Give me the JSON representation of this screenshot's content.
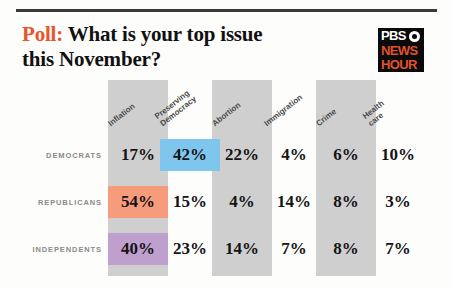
{
  "header": {
    "poll_label": "Poll:",
    "title_line1": "What is your top issue",
    "title_line2": "this November?"
  },
  "logo": {
    "pbs": "PBS",
    "news": "NEWS",
    "hour": "HOUR"
  },
  "colors": {
    "accent_orange": "#e8552a",
    "band_gray": "#cfcfcf",
    "highlight_blue": "#7fc6ee",
    "highlight_salmon": "#f79b7d",
    "highlight_purple": "#bf9fce",
    "logo_black": "#0a0a0a"
  },
  "chart_data": {
    "type": "table",
    "title": "Poll: What is your top issue this November?",
    "categories": [
      "Inflation",
      "Preserving Democracy",
      "Abortion",
      "Immigration",
      "Crime",
      "Health care"
    ],
    "column_headers": [
      {
        "line1": "Inflation",
        "line2": ""
      },
      {
        "line1": "Preserving",
        "line2": "Democracy"
      },
      {
        "line1": "Abortion",
        "line2": ""
      },
      {
        "line1": "Immigration",
        "line2": ""
      },
      {
        "line1": "Crime",
        "line2": ""
      },
      {
        "line1": "Health",
        "line2": "care"
      }
    ],
    "rows": [
      {
        "label": "DEMOCRATS",
        "values": [
          "17%",
          "42%",
          "22%",
          "4%",
          "6%",
          "10%"
        ],
        "highlight_index": 1,
        "highlight_color": "#7fc6ee"
      },
      {
        "label": "REPUBLICANS",
        "values": [
          "54%",
          "15%",
          "4%",
          "14%",
          "8%",
          "3%"
        ],
        "highlight_index": 0,
        "highlight_color": "#f79b7d"
      },
      {
        "label": "INDEPENDENTS",
        "values": [
          "40%",
          "23%",
          "14%",
          "7%",
          "8%",
          "7%"
        ],
        "highlight_index": 0,
        "highlight_color": "#bf9fce"
      }
    ],
    "banded_columns": [
      0,
      2,
      4
    ],
    "ylabel": "",
    "xlabel": "",
    "grid": false,
    "legend": "none"
  }
}
